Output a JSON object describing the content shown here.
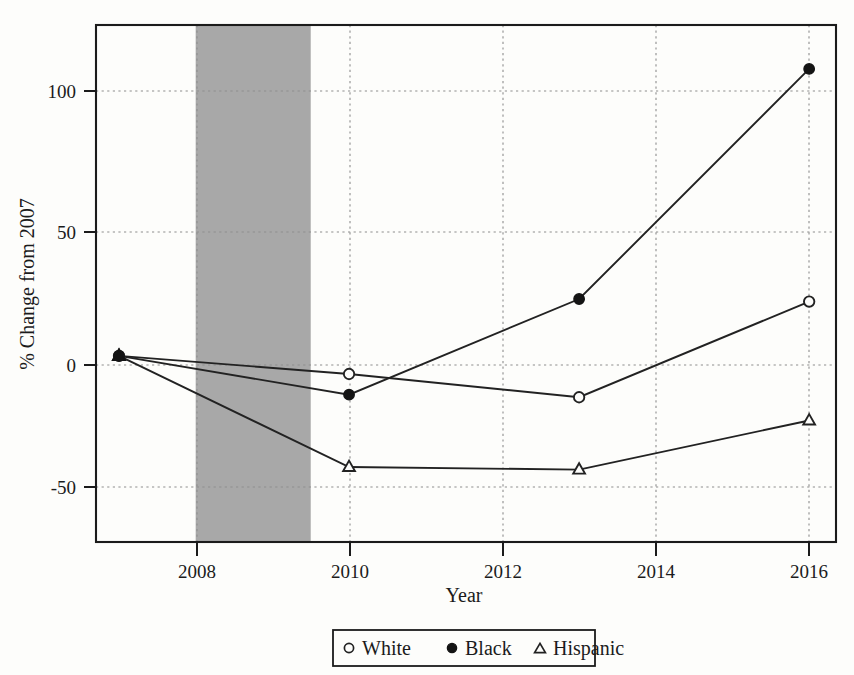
{
  "chart_data": {
    "type": "line",
    "title": "",
    "xlabel": "Year",
    "ylabel": "% Change from 2007",
    "x": [
      2007,
      2010,
      2013,
      2016
    ],
    "xlim": [
      2006.7,
      2016.35
    ],
    "ylim": [
      -72,
      128
    ],
    "xticks": [
      2008,
      2010,
      2012,
      2014,
      2016
    ],
    "xtick_labels": [
      "2008",
      "2010",
      "2012",
      "2014",
      "2016"
    ],
    "yticks": [
      100,
      50,
      0,
      -50
    ],
    "ytick_labels": [
      "100",
      "50",
      "0",
      "-50"
    ],
    "grid": "dotted-both-axes",
    "legend_position": "below-axes-center",
    "series": [
      {
        "name": "White",
        "marker": "open-circle",
        "values": [
          0,
          -7,
          -16,
          21
        ]
      },
      {
        "name": "Black",
        "marker": "filled-circle",
        "values": [
          0,
          -15,
          22,
          111
        ]
      },
      {
        "name": "Hispanic",
        "marker": "open-triangle",
        "values": [
          0,
          -43,
          -44,
          -25
        ]
      }
    ],
    "shaded_regions": [
      {
        "name": "recession-band",
        "x_start": 2008.0,
        "x_end": 2009.5,
        "color": "#a8a8a8"
      }
    ],
    "colors": {
      "line": "#222222",
      "grid": "#9a9a9a",
      "axis": "#1b1b1b",
      "shading": "#a8a8a8",
      "background": "#fdfdfb"
    }
  },
  "legend": {
    "items": [
      {
        "label": "White",
        "marker": "open-circle"
      },
      {
        "label": "Black",
        "marker": "filled-circle"
      },
      {
        "label": "Hispanic",
        "marker": "open-triangle"
      }
    ]
  }
}
